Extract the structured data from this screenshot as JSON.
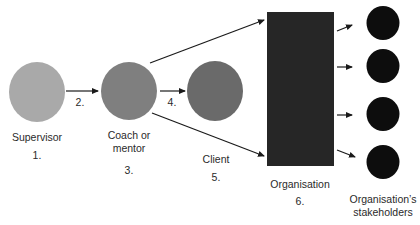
{
  "colors": {
    "supervisor": "#a9a9a9",
    "coach": "#7f7f7f",
    "client": "#6a6a6a",
    "organisation": "#262626",
    "stakeholder": "#0d0d0d",
    "arrow": "#1a1a1a",
    "text": "#2a2a2a"
  },
  "nodes": {
    "supervisor": {
      "label": "Supervisor",
      "number": "1."
    },
    "coach": {
      "label_line1": "Coach or",
      "label_line2": "mentor",
      "number": "3."
    },
    "client": {
      "label": "Client",
      "number": "5."
    },
    "organisation": {
      "label": "Organisation",
      "number": "6."
    },
    "stakeholders": {
      "label_line1": "Organisation’s",
      "label_line2": "stakeholders",
      "count": 4
    }
  },
  "edges": {
    "supervisor_to_coach": {
      "number": "2."
    },
    "coach_to_client": {
      "number": "4."
    },
    "coach_to_organisation_top": {
      "number": ""
    },
    "coach_to_organisation_bottom": {
      "number": ""
    }
  }
}
